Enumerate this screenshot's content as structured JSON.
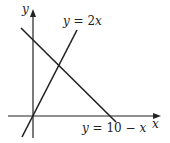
{
  "figure": {
    "type": "coordinate-graph",
    "axes": {
      "x_label": "x",
      "y_label": "y"
    },
    "lines": [
      {
        "id": "line-2x",
        "equation": "y = 2x",
        "label_parts": {
          "lhs": "y",
          "eq": " = 2",
          "var": "x"
        }
      },
      {
        "id": "line-10-minus-x",
        "equation": "y = 10 − x",
        "label_parts": {
          "lhs": "y",
          "eq": " = 10 − ",
          "var": "x"
        }
      }
    ],
    "colors": {
      "stroke": "#222222",
      "background": "#ffffff"
    }
  }
}
